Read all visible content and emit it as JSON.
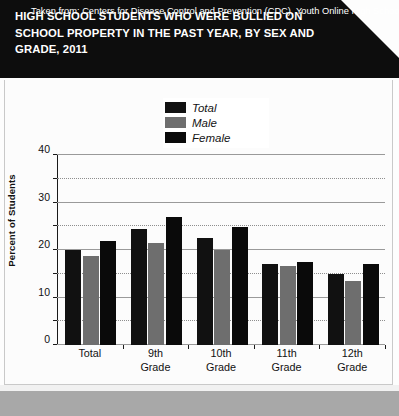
{
  "header": {
    "title": "HIGH SCHOOL STUDENTS WHO WERE BULLIED ON SCHOOL PROPERTY IN THE PAST YEAR, BY SEX AND GRADE, 2011"
  },
  "footer": {
    "text": "Taken from: Centers for Disease Control and Prevention (CDC), Youth Online High School"
  },
  "colors": {
    "banner": "#0d0d0d",
    "total": "#111111",
    "male": "#6e6e6e",
    "female": "#0a0a0a",
    "footer_band": "#a8a8a8"
  },
  "chart_data": {
    "type": "bar",
    "title": "HIGH SCHOOL STUDENTS WHO WERE BULLIED ON SCHOOL PROPERTY IN THE PAST YEAR, BY SEX AND GRADE, 2011",
    "xlabel": "",
    "ylabel": "Percent of Students",
    "ylim": [
      0,
      40
    ],
    "yticks": [
      0,
      10,
      20,
      30,
      40
    ],
    "yticks_minor": [
      5,
      15,
      25,
      35
    ],
    "grid": true,
    "legend_position": "top-center",
    "categories": [
      "Total",
      "9th Grade",
      "10th Grade",
      "11th Grade",
      "12th Grade"
    ],
    "category_lines": [
      [
        "Total"
      ],
      [
        "9th",
        "Grade"
      ],
      [
        "10th",
        "Grade"
      ],
      [
        "11th",
        "Grade"
      ],
      [
        "12th",
        "Grade"
      ]
    ],
    "series": [
      {
        "name": "Total",
        "color": "#111111",
        "values": [
          20.0,
          24.5,
          22.5,
          17.0,
          15.0
        ]
      },
      {
        "name": "Male",
        "color": "#6e6e6e",
        "values": [
          18.8,
          21.5,
          20.0,
          16.6,
          13.5
        ]
      },
      {
        "name": "Female",
        "color": "#0a0a0a",
        "values": [
          22.0,
          27.0,
          24.8,
          17.5,
          17.0
        ]
      }
    ]
  }
}
